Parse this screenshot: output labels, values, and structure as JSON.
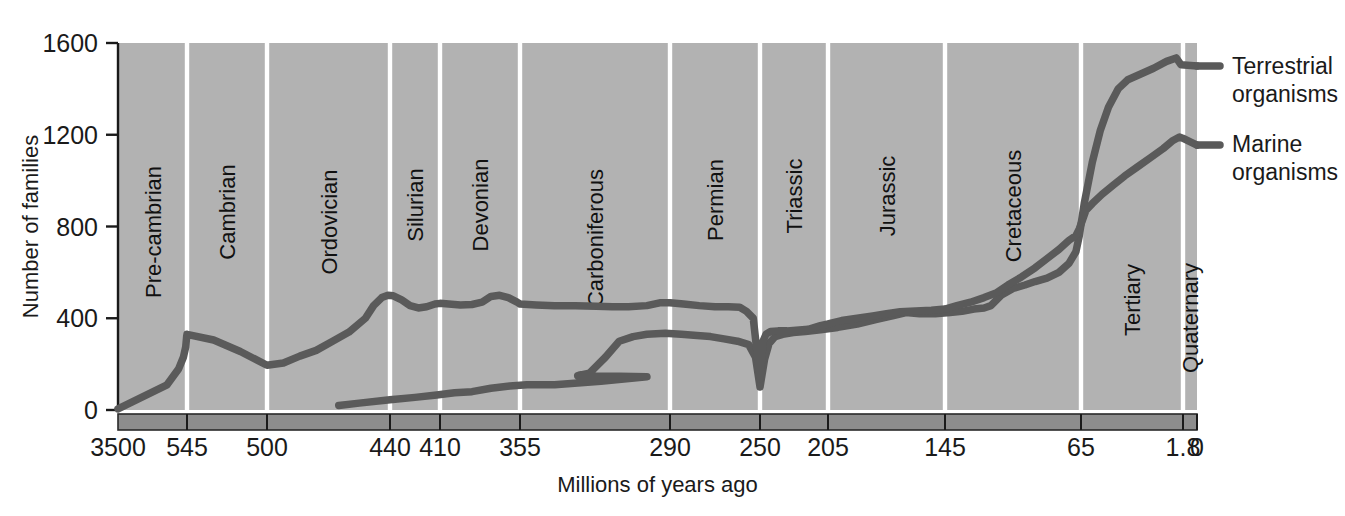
{
  "chart_data": {
    "type": "line",
    "title": "",
    "xlabel": "Millions of years ago",
    "ylabel": "Number of families",
    "xlim": [
      3500,
      0
    ],
    "ylim": [
      0,
      1600
    ],
    "grid": false,
    "x_reversed": true,
    "x_ticks": [
      "3500",
      "545",
      "500",
      "440",
      "410",
      "355",
      "290",
      "250",
      "205",
      "145",
      "65",
      "1.8",
      "0"
    ],
    "y_ticks": [
      "0",
      "400",
      "800",
      "1200",
      "1600"
    ],
    "legend_position": "right",
    "bands": [
      {
        "label": "Pre-cambrian",
        "start": 3500,
        "end": 545
      },
      {
        "label": "Cambrian",
        "start": 545,
        "end": 500
      },
      {
        "label": "Ordovician",
        "start": 500,
        "end": 440
      },
      {
        "label": "Silurian",
        "start": 440,
        "end": 410
      },
      {
        "label": "Devonian",
        "start": 410,
        "end": 355
      },
      {
        "label": "Carboniferous",
        "start": 355,
        "end": 290
      },
      {
        "label": "Permian",
        "start": 290,
        "end": 250
      },
      {
        "label": "Triassic",
        "start": 250,
        "end": 205
      },
      {
        "label": "Jurassic",
        "start": 205,
        "end": 145
      },
      {
        "label": "Cretaceous",
        "start": 145,
        "end": 65
      },
      {
        "label": "Tertiary",
        "start": 65,
        "end": 1.8
      },
      {
        "label": "Quaternary",
        "start": 1.8,
        "end": 0
      }
    ],
    "series": [
      {
        "name": "Terrestrial organisms",
        "color": "#5a5a5a",
        "points": [
          [
            465,
            20
          ],
          [
            455,
            30
          ],
          [
            440,
            45
          ],
          [
            425,
            55
          ],
          [
            412,
            65
          ],
          [
            400,
            75
          ],
          [
            388,
            80
          ],
          [
            375,
            95
          ],
          [
            362,
            105
          ],
          [
            352,
            110
          ],
          [
            340,
            110
          ],
          [
            330,
            118
          ],
          [
            320,
            125
          ],
          [
            310,
            135
          ],
          [
            300,
            145
          ],
          [
            330,
            150
          ],
          [
            325,
            160
          ],
          [
            318,
            230
          ],
          [
            312,
            300
          ],
          [
            306,
            320
          ],
          [
            300,
            330
          ],
          [
            292,
            335
          ],
          [
            285,
            330
          ],
          [
            278,
            325
          ],
          [
            272,
            320
          ],
          [
            266,
            310
          ],
          [
            260,
            300
          ],
          [
            255,
            285
          ],
          [
            252,
            230
          ],
          [
            250,
            100
          ],
          [
            247,
            220
          ],
          [
            244,
            290
          ],
          [
            240,
            320
          ],
          [
            235,
            330
          ],
          [
            228,
            338
          ],
          [
            220,
            342
          ],
          [
            210,
            350
          ],
          [
            200,
            360
          ],
          [
            190,
            375
          ],
          [
            180,
            395
          ],
          [
            172,
            410
          ],
          [
            165,
            425
          ],
          [
            158,
            420
          ],
          [
            150,
            420
          ],
          [
            142,
            425
          ],
          [
            135,
            430
          ],
          [
            128,
            440
          ],
          [
            122,
            445
          ],
          [
            118,
            455
          ],
          [
            112,
            500
          ],
          [
            105,
            530
          ],
          [
            98,
            545
          ],
          [
            92,
            560
          ],
          [
            85,
            575
          ],
          [
            78,
            600
          ],
          [
            72,
            640
          ],
          [
            68,
            690
          ],
          [
            66,
            760
          ],
          [
            63,
            900
          ],
          [
            58,
            1080
          ],
          [
            53,
            1220
          ],
          [
            48,
            1320
          ],
          [
            42,
            1400
          ],
          [
            36,
            1440
          ],
          [
            28,
            1465
          ],
          [
            20,
            1490
          ],
          [
            12,
            1520
          ],
          [
            6,
            1535
          ],
          [
            3,
            1505
          ],
          [
            0,
            1500
          ]
        ]
      },
      {
        "name": "Marine organisms",
        "color": "#5a5a5a",
        "points": [
          [
            3500,
            5
          ],
          [
            1400,
            110
          ],
          [
            900,
            180
          ],
          [
            700,
            230
          ],
          [
            600,
            275
          ],
          [
            560,
            320
          ],
          [
            545,
            330
          ],
          [
            530,
            305
          ],
          [
            515,
            255
          ],
          [
            500,
            195
          ],
          [
            492,
            205
          ],
          [
            484,
            235
          ],
          [
            476,
            260
          ],
          [
            468,
            300
          ],
          [
            460,
            340
          ],
          [
            452,
            400
          ],
          [
            448,
            455
          ],
          [
            444,
            490
          ],
          [
            441,
            500
          ],
          [
            438,
            498
          ],
          [
            433,
            480
          ],
          [
            428,
            455
          ],
          [
            423,
            445
          ],
          [
            418,
            450
          ],
          [
            413,
            462
          ],
          [
            410,
            465
          ],
          [
            404,
            462
          ],
          [
            396,
            458
          ],
          [
            388,
            460
          ],
          [
            381,
            470
          ],
          [
            375,
            495
          ],
          [
            369,
            500
          ],
          [
            363,
            490
          ],
          [
            357,
            470
          ],
          [
            355,
            462
          ],
          [
            348,
            458
          ],
          [
            340,
            455
          ],
          [
            331,
            455
          ],
          [
            322,
            452
          ],
          [
            315,
            450
          ],
          [
            308,
            450
          ],
          [
            300,
            455
          ],
          [
            294,
            468
          ],
          [
            290,
            468
          ],
          [
            284,
            462
          ],
          [
            277,
            455
          ],
          [
            270,
            450
          ],
          [
            264,
            450
          ],
          [
            259,
            448
          ],
          [
            256,
            430
          ],
          [
            253,
            400
          ],
          [
            250,
            135
          ],
          [
            248,
            300
          ],
          [
            246,
            330
          ],
          [
            243,
            342
          ],
          [
            238,
            345
          ],
          [
            232,
            345
          ],
          [
            226,
            348
          ],
          [
            218,
            352
          ],
          [
            210,
            368
          ],
          [
            205,
            375
          ],
          [
            198,
            390
          ],
          [
            190,
            400
          ],
          [
            182,
            410
          ],
          [
            175,
            420
          ],
          [
            168,
            428
          ],
          [
            160,
            432
          ],
          [
            152,
            435
          ],
          [
            145,
            440
          ],
          [
            138,
            455
          ],
          [
            130,
            470
          ],
          [
            122,
            490
          ],
          [
            115,
            510
          ],
          [
            108,
            545
          ],
          [
            100,
            580
          ],
          [
            92,
            620
          ],
          [
            85,
            660
          ],
          [
            78,
            700
          ],
          [
            72,
            740
          ],
          [
            68,
            760
          ],
          [
            66,
            790
          ],
          [
            64,
            830
          ],
          [
            62,
            870
          ],
          [
            58,
            900
          ],
          [
            52,
            940
          ],
          [
            45,
            980
          ],
          [
            38,
            1020
          ],
          [
            30,
            1060
          ],
          [
            22,
            1100
          ],
          [
            14,
            1140
          ],
          [
            8,
            1175
          ],
          [
            4,
            1190
          ],
          [
            2,
            1185
          ],
          [
            0,
            1155
          ]
        ]
      }
    ]
  },
  "legend": {
    "terrestrial_line1": "Terrestrial",
    "terrestrial_line2": "organisms",
    "marine_line1": "Marine",
    "marine_line2": "organisms"
  },
  "colors": {
    "plot_background": "#b2b2b2",
    "divider": "#ffffff",
    "line": "#5a5a5a",
    "axis_bar": "#8d8d8d",
    "axis_text": "#1a1a1a",
    "page_background": "#ffffff"
  }
}
